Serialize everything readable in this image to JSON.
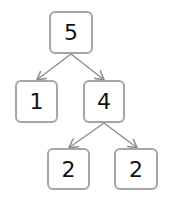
{
  "diagram": {
    "type": "tree",
    "edge_color": "#8c8c8c",
    "box_border_color": "#a6a6a6",
    "nodes": [
      {
        "id": "root",
        "label": "5"
      },
      {
        "id": "left",
        "label": "1"
      },
      {
        "id": "right",
        "label": "4"
      },
      {
        "id": "right-left",
        "label": "2"
      },
      {
        "id": "right-right",
        "label": "2"
      }
    ],
    "edges": [
      {
        "from": "root",
        "to": "left"
      },
      {
        "from": "root",
        "to": "right"
      },
      {
        "from": "right",
        "to": "right-left"
      },
      {
        "from": "right",
        "to": "right-right"
      }
    ]
  }
}
